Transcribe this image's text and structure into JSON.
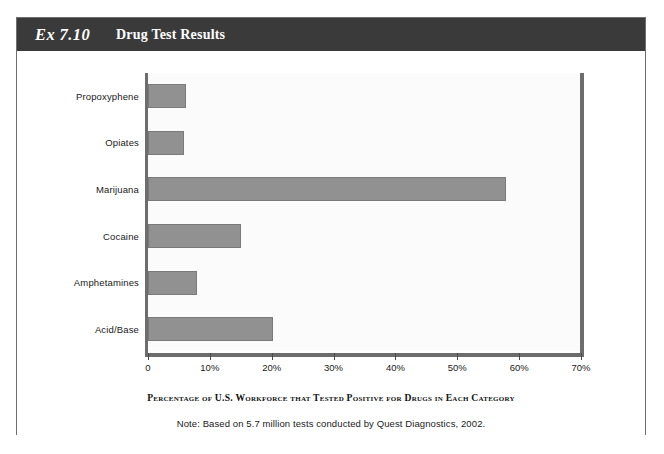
{
  "page": {
    "corner_mark_left": "",
    "corner_mark_right": ""
  },
  "exhibit": {
    "number": "Ex 7.10",
    "title": "Drug Test Results"
  },
  "chart_data": {
    "type": "bar",
    "orientation": "horizontal",
    "title": "Drug Test Results",
    "categories": [
      "Propoxyphene",
      "Opiates",
      "Marijuana",
      "Cocaine",
      "Amphetamines",
      "Acid/Base"
    ],
    "values": [
      6.1,
      5.8,
      57.8,
      15.0,
      8.0,
      20.2
    ],
    "xlabel": "Percentage of U.S. Workforce that Tested Positive for Drugs in Each Category",
    "ylabel": "",
    "xlim": [
      0,
      70
    ],
    "xticks": [
      0,
      10,
      20,
      30,
      40,
      50,
      60,
      70
    ],
    "xticklabels": [
      "0",
      "10%",
      "20%",
      "30%",
      "40%",
      "50%",
      "60%",
      "70%"
    ],
    "grid": false,
    "legend": false,
    "bar_color": "#919191",
    "bar_border_color": "#7a7a7a",
    "axis_color": "#6d6d6d",
    "plot_background": "#fbfbfb",
    "note": "Note: Based on 5.7 million tests conducted by Quest Diagnostics, 2002."
  }
}
